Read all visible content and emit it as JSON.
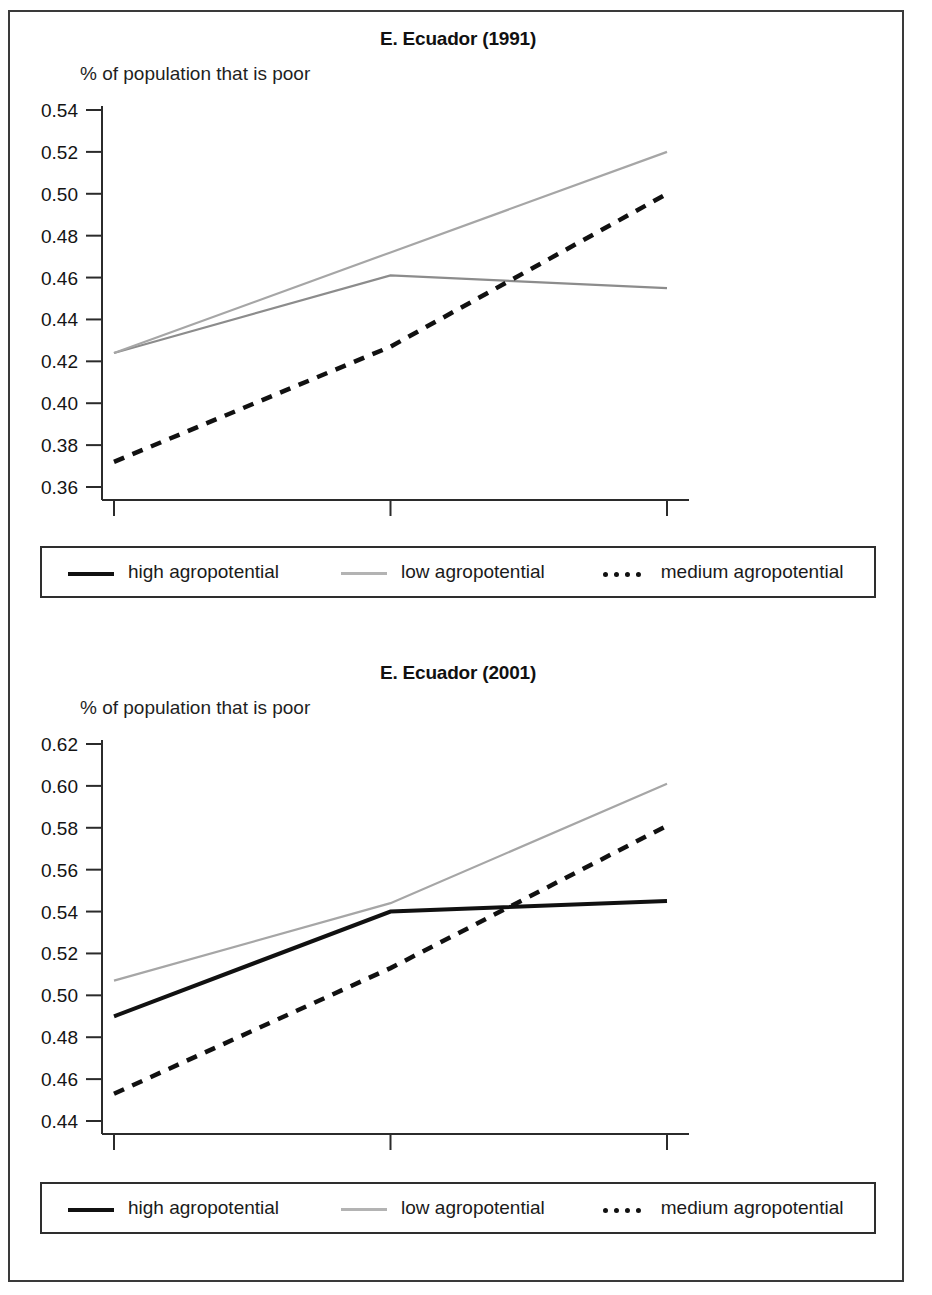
{
  "figure": {
    "legend_entries": [
      {
        "label": "high agropotential",
        "style": "solid",
        "color": "#111111"
      },
      {
        "label": "low agropotential",
        "style": "thin",
        "color": "#a6a6a6"
      },
      {
        "label": "medium agropotential",
        "style": "dashed",
        "color": "#111111"
      }
    ]
  },
  "chart_data": [
    {
      "type": "line",
      "title": "E. Ecuador (1991)",
      "ylabel": "% of population that is poor",
      "xlabel": "",
      "categories": [
        "Good access",
        "Moderate access",
        "Low access"
      ],
      "ytick_labels": [
        "0.54",
        "0.52",
        "0.50",
        "0.48",
        "0.46",
        "0.44",
        "0.42",
        "0.40",
        "0.38",
        "0.36"
      ],
      "ylim": [
        0.355,
        0.545
      ],
      "grid": false,
      "legend_position": "below-plot",
      "series": [
        {
          "name": "high agropotential",
          "values": [
            0.424,
            0.461,
            0.455
          ],
          "style": "solid-faded",
          "color": "#8c8c8c"
        },
        {
          "name": "low agropotential",
          "values": [
            0.424,
            0.472,
            0.52
          ],
          "style": "thin",
          "color": "#a6a6a6"
        },
        {
          "name": "medium agropotential",
          "values": [
            0.372,
            0.427,
            0.5
          ],
          "style": "dashed",
          "color": "#111111"
        }
      ]
    },
    {
      "type": "line",
      "title": "E. Ecuador (2001)",
      "ylabel": "% of population that is poor",
      "xlabel": "",
      "categories": [
        "Good access",
        "Moderate access",
        "Low access"
      ],
      "ytick_labels": [
        "0.62",
        "0.60",
        "0.58",
        "0.56",
        "0.54",
        "0.52",
        "0.50",
        "0.48",
        "0.46",
        "0.44"
      ],
      "ylim": [
        0.435,
        0.625
      ],
      "grid": false,
      "legend_position": "below-plot",
      "series": [
        {
          "name": "high agropotential",
          "values": [
            0.49,
            0.54,
            0.545
          ],
          "style": "solid",
          "color": "#111111"
        },
        {
          "name": "low agropotential",
          "values": [
            0.507,
            0.544,
            0.601
          ],
          "style": "thin",
          "color": "#a6a6a6"
        },
        {
          "name": "medium agropotential",
          "values": [
            0.453,
            0.513,
            0.581
          ],
          "style": "dashed",
          "color": "#111111"
        }
      ]
    }
  ]
}
